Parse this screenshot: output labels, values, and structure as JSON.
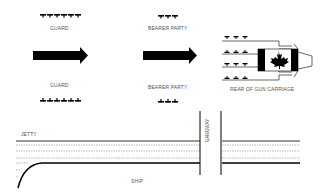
{
  "diagram": {
    "top": {
      "guard_label": "GUARD",
      "bearer_label": "BEARER PARTY"
    },
    "bottom": {
      "guard_label": "GUARD",
      "bearer_label": "BEARER PARTY"
    },
    "gun_carriage_label": "REAR OF  GUN CARRIAGE",
    "jetty_label": "JETTY",
    "gangway_label": "GANGWAY",
    "ship_label": "SHIP",
    "guard_count": 6,
    "bearer_count": 3,
    "colors": {
      "ink": "#000000",
      "text": "#555555",
      "dash": "#888888"
    }
  }
}
